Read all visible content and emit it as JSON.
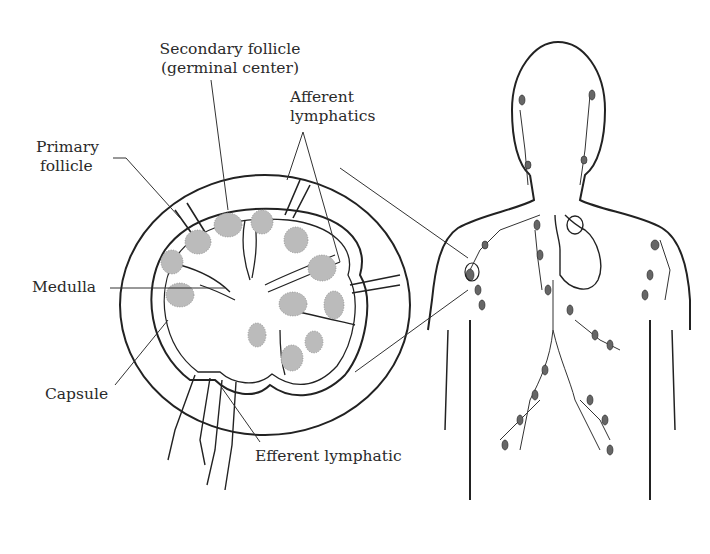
{
  "labels": {
    "secondary_follicle": [
      "Secondary follicle",
      "(germinal center)"
    ],
    "afferent_lymphatics": [
      "Afferent",
      "lymphatics"
    ],
    "primary_follicle": [
      "Primary",
      "follicle"
    ],
    "medulla": "Medulla",
    "capsule": "Capsule",
    "efferent_lymphatic": "Efferent lymphatic"
  },
  "figures": {
    "lymph_node_cross_section": "magnified lymph node",
    "human_torso": "lymphatic system of upper body"
  },
  "colors": {
    "line": "#222222",
    "background": "#ffffff"
  }
}
